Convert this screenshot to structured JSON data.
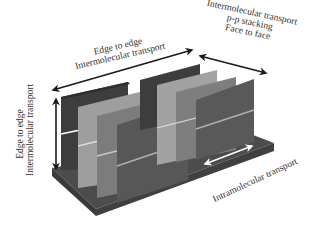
{
  "figure": {
    "type": "3d-schematic",
    "colors": {
      "background": "#ffffff",
      "base": "#4a4a4a",
      "base_side": "#3a3a3a",
      "slab_darkest": "#3d3d3d",
      "slab_light": "#9a9a9a",
      "slab_mid": "#7a7a7a",
      "slab_front": "#565656",
      "arrow_black": "#1a1a1a",
      "arrow_white": "#ffffff",
      "text": "#333333"
    }
  },
  "labels": {
    "edge_to_edge_horizontal": {
      "line1": "Edge to edge",
      "line2": "Intermolecular transport"
    },
    "face_to_face": {
      "line1": "Intermolecular transport",
      "line2": "p-p stacking",
      "line3": "Face to face"
    },
    "edge_to_edge_vertical": {
      "line1": "Edge to edge",
      "line2": "Intermolecular transport"
    },
    "intramolecular": {
      "line1": "Intramolecular transport"
    }
  },
  "arrows": [
    {
      "name": "edge-to-edge-horizontal-arrow",
      "direction": "bidirectional",
      "color": "black"
    },
    {
      "name": "face-to-face-arrow",
      "direction": "bidirectional",
      "color": "black"
    },
    {
      "name": "edge-to-edge-vertical-arrow",
      "direction": "bidirectional",
      "color": "black"
    },
    {
      "name": "intramolecular-arrow",
      "direction": "bidirectional",
      "color": "white"
    }
  ]
}
